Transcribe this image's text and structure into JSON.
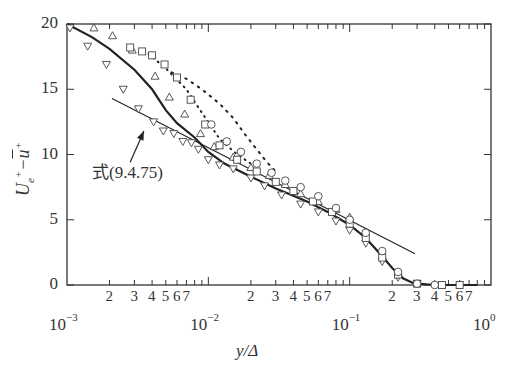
{
  "chart_data": {
    "type": "scatter",
    "title": "",
    "xlabel": "y/Δ",
    "ylabel": "Ue⁺ − ū⁺",
    "xscale": "log",
    "xlim": [
      0.001,
      1.0
    ],
    "ylim": [
      0,
      20
    ],
    "grid": false,
    "legend": "none",
    "yticks": [
      0,
      5,
      10,
      15,
      20
    ],
    "ytick_labels": [
      "0",
      "5",
      "10",
      "15",
      "20"
    ],
    "xticks_major": [
      0.001,
      0.01,
      0.1,
      1.0
    ],
    "xtick_major_labels": [
      {
        "base": "10",
        "exp": "−3"
      },
      {
        "base": "10",
        "exp": "−2"
      },
      {
        "base": "10",
        "exp": "−1"
      },
      {
        "base": "10",
        "exp": "0"
      }
    ],
    "xtick_minor_labels": [
      "2",
      "3",
      "4",
      "5",
      "6",
      "7"
    ],
    "annotation": {
      "text": "式(9.4.75)",
      "arrow_from": [
        0.0028,
        9.4
      ],
      "arrow_to": [
        0.0035,
        11.8
      ]
    },
    "series": [
      {
        "name": "式(9.4.75) reference line",
        "style": "thin-solid-line",
        "x": [
          0.00208,
          0.29
        ],
        "y": [
          14.3,
          2.4
        ]
      },
      {
        "name": "solid curve",
        "style": "thick-solid-line",
        "x": [
          0.001,
          0.0015,
          0.002,
          0.003,
          0.004,
          0.005,
          0.006,
          0.008,
          0.01,
          0.013,
          0.02,
          0.03,
          0.05,
          0.07,
          0.1,
          0.13,
          0.17,
          0.2,
          0.24,
          0.28,
          0.35,
          0.5,
          0.8
        ],
        "y": [
          20,
          19.0,
          18.1,
          16.5,
          15.0,
          13.4,
          12.4,
          11.3,
          10.2,
          9.3,
          8.3,
          7.4,
          6.4,
          5.6,
          4.6,
          3.6,
          2.2,
          1.3,
          0.5,
          0.15,
          0.05,
          0.0,
          0.0
        ]
      },
      {
        "name": "dotted curve (dense dots)",
        "style": "dotted-line",
        "x": [
          0.0055,
          0.007,
          0.009,
          0.012,
          0.015,
          0.018,
          0.022,
          0.026,
          0.03
        ],
        "y": [
          16.3,
          15.8,
          15.0,
          13.9,
          12.8,
          11.6,
          10.4,
          9.4,
          8.7
        ]
      },
      {
        "name": "dotted curve (sparse, with squares)",
        "style": "dotted-line",
        "x": [
          0.0035,
          0.005,
          0.007,
          0.009,
          0.012,
          0.016,
          0.02
        ],
        "y": [
          18.0,
          16.6,
          15.0,
          13.2,
          11.2,
          10.0,
          9.3
        ]
      },
      {
        "name": "upward triangles",
        "marker": "triangle-up",
        "x": [
          0.00155,
          0.0021,
          0.0029,
          0.0042,
          0.0053,
          0.0068,
          0.0088,
          0.011,
          0.015,
          0.02,
          0.027,
          0.035,
          0.045,
          0.06,
          0.08,
          0.1
        ],
        "y": [
          19.7,
          19.1,
          18.0,
          16.0,
          14.4,
          13.1,
          11.6,
          10.6,
          9.8,
          9.0,
          8.4,
          7.7,
          7.0,
          6.4,
          5.8,
          5.2
        ]
      },
      {
        "name": "downward triangles",
        "marker": "triangle-down",
        "x": [
          0.00105,
          0.0014,
          0.0019,
          0.0025,
          0.0032,
          0.0041,
          0.0048,
          0.0057,
          0.0066,
          0.0076,
          0.0085,
          0.01,
          0.012,
          0.015,
          0.02,
          0.025,
          0.033,
          0.045,
          0.06,
          0.08,
          0.1,
          0.13,
          0.17,
          0.22,
          0.3
        ],
        "y": [
          19.7,
          18.3,
          16.9,
          15.0,
          13.5,
          12.5,
          11.8,
          11.6,
          11.0,
          10.9,
          10.4,
          9.6,
          9.2,
          8.9,
          8.2,
          7.6,
          6.9,
          6.2,
          5.6,
          4.9,
          4.2,
          3.2,
          1.8,
          0.6,
          0.1
        ]
      },
      {
        "name": "squares",
        "marker": "square",
        "x": [
          0.0028,
          0.0034,
          0.004,
          0.0049,
          0.006,
          0.0075,
          0.0095,
          0.012,
          0.016,
          0.022,
          0.03,
          0.04,
          0.055,
          0.075,
          0.1,
          0.13,
          0.17,
          0.22,
          0.3,
          0.45,
          0.6
        ],
        "y": [
          18.2,
          17.9,
          17.6,
          16.9,
          15.9,
          14.2,
          12.3,
          10.7,
          9.6,
          8.7,
          7.9,
          7.2,
          6.4,
          5.6,
          4.7,
          3.6,
          2.1,
          0.8,
          0.1,
          0.0,
          0.0
        ]
      },
      {
        "name": "circles",
        "marker": "circle",
        "x": [
          0.0105,
          0.0135,
          0.017,
          0.022,
          0.028,
          0.035,
          0.045,
          0.06,
          0.08,
          0.1,
          0.13,
          0.17,
          0.22,
          0.3,
          0.4
        ],
        "y": [
          12.3,
          11.0,
          10.2,
          9.3,
          8.6,
          8.0,
          7.5,
          6.8,
          5.9,
          5.0,
          4.0,
          2.6,
          1.0,
          0.1,
          0.0
        ]
      }
    ]
  }
}
